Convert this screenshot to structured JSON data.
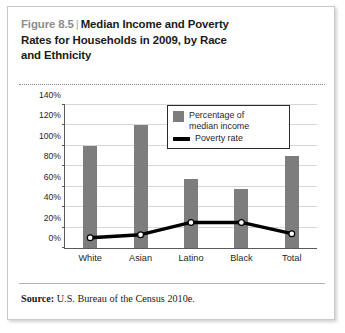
{
  "figure": {
    "number_label": "Figure 8.5",
    "separator": "|",
    "title": "Median Income and Poverty Rates for Households in 2009, by Race and Ethnicity",
    "title_line1": "Median Income and Poverty",
    "title_line2": "Rates for Households in 2009, by Race",
    "title_line3": "and Ethnicity",
    "source_label": "Source:",
    "source_text": "U.S. Bureau of the Census 2010e."
  },
  "legend": {
    "items": [
      {
        "label_line1": "Percentage of",
        "label_line2": "median income",
        "type": "swatch",
        "color": "#7d7d7d"
      },
      {
        "label_line1": "Poverty rate",
        "label_line2": "",
        "type": "line",
        "color": "#000000"
      }
    ]
  },
  "chart_data": {
    "type": "bar",
    "title": "Median Income and Poverty Rates for Households in 2009, by Race and Ethnicity",
    "xlabel": "",
    "ylabel": "",
    "ylim": [
      0,
      140
    ],
    "ytick_values": [
      0,
      20,
      40,
      60,
      80,
      100,
      120,
      140
    ],
    "ytick_labels": [
      "0%",
      "20%",
      "40%",
      "60%",
      "80%",
      "100%",
      "120%",
      "140%"
    ],
    "grid": true,
    "legend_position": "upper-right",
    "categories": [
      "White",
      "Asian",
      "Latino",
      "Black",
      "Total"
    ],
    "series": [
      {
        "name": "Percentage of median income",
        "type": "bar",
        "color": "#7d7d7d",
        "values": [
          100,
          120,
          68,
          58,
          90
        ]
      },
      {
        "name": "Poverty rate",
        "type": "line",
        "color": "#000000",
        "marker": "circle-white",
        "values": [
          10,
          13,
          25,
          25,
          14
        ]
      }
    ]
  }
}
